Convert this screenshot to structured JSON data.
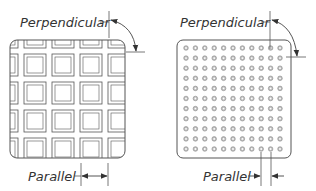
{
  "diagram": {
    "colors": {
      "line": "#555555",
      "text": "#333333",
      "dot_fill": "#bdbdbd",
      "background": "#ffffff"
    },
    "left_panel": {
      "pattern": "square-grid",
      "label_perpendicular": "Perpendicular",
      "label_parallel": "Parallel",
      "parallel_arrow_direction": "outward"
    },
    "right_panel": {
      "pattern": "dot-grid",
      "dot_rows": 11,
      "dot_cols": 11,
      "label_perpendicular": "Perpendicular",
      "label_parallel": "Parallel",
      "parallel_arrow_direction": "inward"
    }
  }
}
